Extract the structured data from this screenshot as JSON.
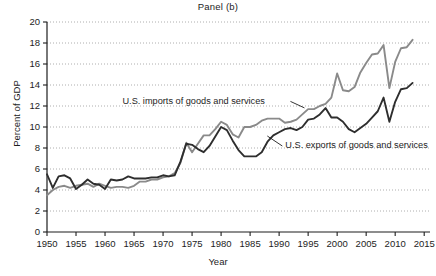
{
  "chart_data": {
    "type": "line",
    "title": "Panel (b)",
    "xlabel": "Year",
    "ylabel": "Percent of GDP",
    "xlim": [
      1950,
      2016
    ],
    "ylim": [
      0,
      20
    ],
    "xticks": [
      1950,
      1955,
      1960,
      1965,
      1970,
      1975,
      1980,
      1985,
      1990,
      1995,
      2000,
      2005,
      2010,
      2015
    ],
    "yticks": [
      0,
      2,
      4,
      6,
      8,
      10,
      12,
      14,
      16,
      18,
      20
    ],
    "grid": "horizontal-dotted",
    "legend": "inline-annotations",
    "x": [
      1950,
      1951,
      1952,
      1953,
      1954,
      1955,
      1956,
      1957,
      1958,
      1959,
      1960,
      1961,
      1962,
      1963,
      1964,
      1965,
      1966,
      1967,
      1968,
      1969,
      1970,
      1971,
      1972,
      1973,
      1974,
      1975,
      1976,
      1977,
      1978,
      1979,
      1980,
      1981,
      1982,
      1983,
      1984,
      1985,
      1986,
      1987,
      1988,
      1989,
      1990,
      1991,
      1992,
      1993,
      1994,
      1995,
      1996,
      1997,
      1998,
      1999,
      2000,
      2001,
      2002,
      2003,
      2004,
      2005,
      2006,
      2007,
      2008,
      2009,
      2010,
      2011,
      2012,
      2013
    ],
    "series": [
      {
        "name": "U.S. imports of goods and services",
        "color": "#8a8a8a",
        "values": [
          3.5,
          4.0,
          4.3,
          4.4,
          4.2,
          4.4,
          4.5,
          4.6,
          4.3,
          4.6,
          4.4,
          4.2,
          4.3,
          4.3,
          4.2,
          4.4,
          4.8,
          4.8,
          5.0,
          5.0,
          5.2,
          5.3,
          5.6,
          6.6,
          8.5,
          7.6,
          8.4,
          9.2,
          9.2,
          9.8,
          10.5,
          10.2,
          9.3,
          9.0,
          10.0,
          10.0,
          10.2,
          10.6,
          10.8,
          10.8,
          10.8,
          10.4,
          10.5,
          10.7,
          11.2,
          11.7,
          11.7,
          12.0,
          12.2,
          12.8,
          15.1,
          13.5,
          13.4,
          13.8,
          15.2,
          16.1,
          16.9,
          17.0,
          17.8,
          13.7,
          16.2,
          17.5,
          17.6,
          18.3
        ]
      },
      {
        "name": "U.S. exports of goods and services",
        "color": "#2e2e2e",
        "values": [
          5.5,
          4.2,
          5.3,
          5.4,
          5.1,
          4.1,
          4.5,
          5.0,
          4.6,
          4.5,
          4.1,
          5.0,
          4.9,
          5.0,
          5.3,
          5.1,
          5.1,
          5.1,
          5.2,
          5.2,
          5.4,
          5.3,
          5.4,
          6.7,
          8.4,
          8.3,
          7.9,
          7.6,
          8.2,
          9.1,
          10.0,
          9.7,
          8.7,
          7.8,
          7.2,
          7.2,
          7.2,
          7.6,
          8.6,
          9.2,
          9.5,
          9.8,
          9.9,
          9.7,
          10.0,
          10.7,
          10.8,
          11.2,
          11.8,
          10.9,
          10.9,
          10.5,
          9.8,
          9.5,
          9.9,
          10.3,
          10.9,
          11.5,
          12.8,
          10.5,
          12.4,
          13.6,
          13.7,
          14.2
        ]
      }
    ],
    "annotations": [
      {
        "label": "U.S. imports of goods and services",
        "x": 1963,
        "y": 12.2
      },
      {
        "label": "U.S. exports of goods and services",
        "x": 1989,
        "y": 8.0
      }
    ]
  }
}
